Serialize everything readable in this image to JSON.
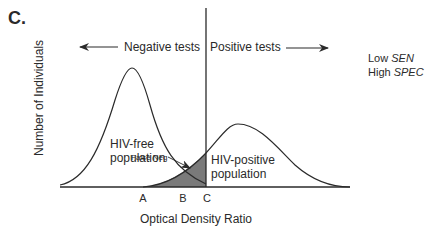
{
  "panel_label": "C.",
  "direction_labels": {
    "negative": "Negative tests",
    "positive": "Positive tests"
  },
  "legend": {
    "line1_prefix": "Low ",
    "line1_term": "SEN",
    "line2_prefix": "High ",
    "line2_term": "SPEC"
  },
  "axes": {
    "ylabel": "Number of Individuals",
    "xlabel": "Optical Density Ratio",
    "ticks": [
      "A",
      "B",
      "C"
    ]
  },
  "curves": {
    "negative_population": [
      "HIV-free",
      "population"
    ],
    "positive_population": [
      "HIV-positive",
      "population"
    ]
  },
  "annotation": "False  Neg",
  "colors": {
    "line": "#2a2a2a",
    "shaded_region": "#7a7a7a"
  }
}
